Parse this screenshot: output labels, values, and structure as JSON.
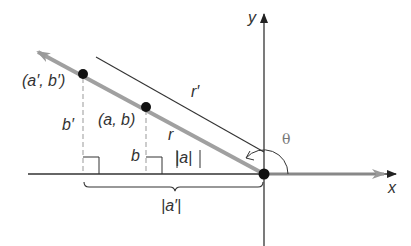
{
  "diagram": {
    "type": "coordinate-geometry",
    "axes": {
      "x_label": "x",
      "y_label": "y"
    },
    "points": [
      {
        "id": "a-prime-b-prime",
        "label": "(a′, b′)"
      },
      {
        "id": "a-b",
        "label": "(a, b)"
      }
    ],
    "labels": {
      "r_prime": "r′",
      "r": "r",
      "b_prime": "b′",
      "b": "b",
      "abs_a": "|a|",
      "abs_a_prime": "|a′|",
      "theta": "θ"
    },
    "colors": {
      "axis": "#333333",
      "ray": "#a0a0a0",
      "point": "#111111",
      "dashed": "#999999",
      "bracket": "#333333"
    }
  }
}
